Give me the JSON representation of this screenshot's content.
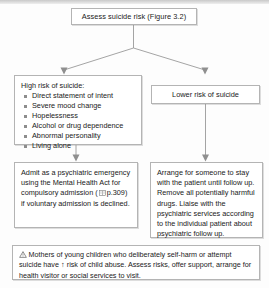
{
  "diagram": {
    "title_box": {
      "text": "Assess suicide risk (Figure 3.2)"
    },
    "high_risk": {
      "heading": "High risk of suicide:",
      "bullets": [
        "Direct statement of intent",
        "Severe mood change",
        "Hopelessness",
        "Alcohol or drug dependence",
        "Abnormal personality",
        "Living alone"
      ]
    },
    "lower_risk": {
      "text": "Lower risk of suicide"
    },
    "admit_action": {
      "text_before_icon": "Admit as a psychiatric emergency using the Mental Health Act for compulsory admission (",
      "icon_name": "book-reference-icon",
      "page_ref": "p.309",
      "text_after_icon": ") if voluntary admission is declined."
    },
    "arrange_action": {
      "text": "Arrange for someone to stay with the patient until follow up. Remove all potentially harmful drugs. Liaise with the psychiatric services according to the individual patient about psychiatric follow up."
    },
    "warning": {
      "icon_name": "warning-triangle-icon",
      "text_before_arrow": "Mothers of young children who deliberately self-harm or attempt suicide have",
      "arrow_symbol": "↑",
      "text_after_arrow": "risk of child abuse. Assess risks, offer support, arrange for health visitor or social services to visit."
    },
    "colors": {
      "box_border": "#b4b4b4",
      "connector": "#9a9a9a",
      "text": "#1a1a1a",
      "background": "#fdfdfd"
    }
  }
}
